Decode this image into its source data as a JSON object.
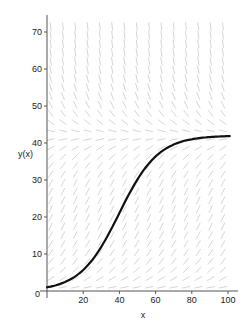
{
  "chart_data": {
    "type": "line",
    "title": "",
    "xlabel": "x",
    "ylabel": "y(x)",
    "xlim": [
      0,
      105
    ],
    "ylim": [
      0,
      74
    ],
    "x_ticks": [
      20,
      40,
      60,
      80,
      100
    ],
    "y_ticks": [
      10,
      20,
      30,
      40,
      50,
      60,
      70
    ],
    "origin_label": "0",
    "grid": false,
    "legend": null,
    "slope_field": {
      "equation": "dy/dx = r*y*(1 - y/K)",
      "r": 0.093,
      "K": 42,
      "color": "#b8b8b8"
    },
    "series": [
      {
        "name": "solution y(x)",
        "color": "#111111",
        "x": [
          0,
          10,
          20,
          30,
          40,
          50,
          60,
          70,
          80,
          90,
          100
        ],
        "values": [
          1.0,
          2.4,
          5.4,
          11.0,
          20.5,
          29.5,
          35.8,
          39.3,
          40.9,
          41.6,
          41.9
        ]
      }
    ]
  }
}
